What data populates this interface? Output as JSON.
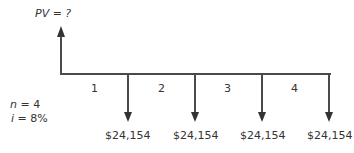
{
  "diagram": {
    "title_label": "PV = ?",
    "params": {
      "n": "n = 4",
      "i": "i = 8%"
    },
    "periods": [
      "1",
      "2",
      "3",
      "4"
    ],
    "cash_flows": [
      "$24,154",
      "$24,154",
      "$24,154",
      "$24,154"
    ],
    "colors": {
      "line": "#4a4a4a",
      "text": "#333333"
    }
  }
}
